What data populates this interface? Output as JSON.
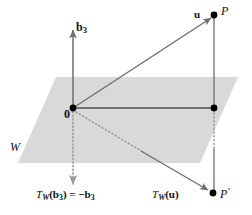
{
  "figure": {
    "plane_label": "W",
    "colors": {
      "plane_fill": "#d9d9d9",
      "line": "#6e6e6e",
      "dot": "#000000",
      "text": "#111111",
      "background": "#ffffff"
    }
  },
  "labels": {
    "basis_vector": "b",
    "basis_vector_sub": "3",
    "vector_u": "u",
    "point_P": "P",
    "point_P_prime": "P",
    "point_P_prime_mark": "′",
    "origin": "0",
    "plane": "W",
    "reflection_b3": "T",
    "reflection_b3_sub": "W",
    "reflection_b3_rest": "(b",
    "reflection_b3_rest2": ") = −b",
    "reflection_u": "T",
    "reflection_u_sub": "W",
    "reflection_u_rest": "(u)"
  },
  "geometry": {
    "plane_corners": [
      [
        56,
        77
      ],
      [
        238,
        77
      ],
      [
        200,
        163
      ],
      [
        18,
        163
      ]
    ],
    "origin": [
      73,
      108
    ],
    "point_P": [
      214,
      15
    ],
    "point_P_projection": [
      214,
      108
    ],
    "point_P_prime": [
      213,
      194
    ],
    "b3_arrow_tip": [
      73,
      27
    ],
    "neg_b3_arrow_tip": [
      73,
      186
    ],
    "axis_top": [
      73,
      27
    ],
    "axis_bottom": [
      73,
      186
    ]
  },
  "elements": {
    "solid_segments": [
      {
        "name": "b3-axis",
        "from": [
          73,
          108
        ],
        "to": [
          73,
          27
        ],
        "arrow": true
      },
      {
        "name": "u-vector",
        "from": [
          73,
          108
        ],
        "to": [
          210,
          18
        ],
        "arrow": true
      },
      {
        "name": "plane-horizontal",
        "from": [
          73,
          108
        ],
        "to": [
          214,
          108
        ],
        "arrow": false
      },
      {
        "name": "P-vertical",
        "from": [
          214,
          15
        ],
        "to": [
          214,
          108
        ],
        "arrow": false
      },
      {
        "name": "Pprime-vertical",
        "from": [
          214,
          148
        ],
        "to": [
          214,
          192
        ],
        "arrow": false
      },
      {
        "name": "Tu-vector",
        "from": [
          140,
          150
        ],
        "to": [
          209,
          191
        ],
        "arrow": true
      }
    ],
    "dotted_segments": [
      {
        "name": "neg-b3-axis",
        "from": [
          73,
          108
        ],
        "to": [
          73,
          186
        ],
        "arrow": true
      },
      {
        "name": "Tu-dotted",
        "from": [
          73,
          112
        ],
        "to": [
          142,
          151
        ],
        "arrow": false
      },
      {
        "name": "Pprime-dotted",
        "from": [
          214,
          112
        ],
        "to": [
          214,
          148
        ],
        "arrow": false
      }
    ],
    "dots": [
      {
        "name": "origin-dot",
        "at": [
          73,
          108
        ]
      },
      {
        "name": "P-dot",
        "at": [
          214,
          15
        ]
      },
      {
        "name": "P-projection-dot",
        "at": [
          214,
          108
        ]
      },
      {
        "name": "Pprime-dot",
        "at": [
          213,
          193
        ]
      }
    ]
  }
}
